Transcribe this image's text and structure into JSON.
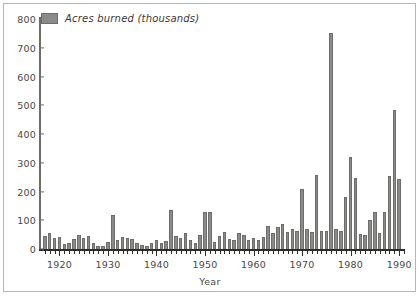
{
  "figure": {
    "background": "#ffffff",
    "frame_color": "#b9b6ae"
  },
  "legend": {
    "label": "Acres burned (thousands)",
    "swatch_color": "#8a8a88"
  },
  "chart_data": {
    "type": "bar",
    "title": "",
    "xlabel": "Year",
    "ylabel": "",
    "ylim": [
      0,
      800
    ],
    "xlim": [
      1916,
      1991
    ],
    "ytick_labels": [
      "0",
      "100",
      "200",
      "300",
      "400",
      "500",
      "600",
      "700",
      "800"
    ],
    "ytick_values": [
      0,
      100,
      200,
      300,
      400,
      500,
      600,
      700,
      800
    ],
    "xtick_labels": [
      "1920",
      "1930",
      "1940",
      "1950",
      "1960",
      "1970",
      "1980",
      "1990"
    ],
    "xtick_values": [
      1920,
      1930,
      1940,
      1950,
      1960,
      1970,
      1980,
      1990
    ],
    "grid": false,
    "legend_position": "top-left",
    "series_name": "Acres burned (thousands)",
    "bar_color": "#8a8a88",
    "categories": [
      1917,
      1918,
      1919,
      1920,
      1921,
      1922,
      1923,
      1924,
      1925,
      1926,
      1927,
      1928,
      1929,
      1930,
      1931,
      1932,
      1933,
      1934,
      1935,
      1936,
      1937,
      1938,
      1939,
      1940,
      1941,
      1942,
      1943,
      1944,
      1945,
      1946,
      1947,
      1948,
      1949,
      1950,
      1951,
      1952,
      1953,
      1954,
      1955,
      1956,
      1957,
      1958,
      1959,
      1960,
      1961,
      1962,
      1963,
      1964,
      1965,
      1966,
      1967,
      1968,
      1969,
      1970,
      1971,
      1972,
      1973,
      1974,
      1975,
      1976,
      1977,
      1978,
      1979,
      1980,
      1981,
      1982,
      1983,
      1984,
      1985,
      1986,
      1987,
      1988,
      1989,
      1990
    ],
    "values": [
      45,
      55,
      38,
      42,
      18,
      20,
      35,
      50,
      40,
      45,
      20,
      12,
      10,
      25,
      118,
      30,
      42,
      38,
      35,
      20,
      15,
      12,
      20,
      30,
      22,
      28,
      135,
      45,
      40,
      55,
      30,
      20,
      50,
      130,
      128,
      25,
      45,
      58,
      35,
      30,
      55,
      48,
      30,
      38,
      32,
      42,
      80,
      55,
      78,
      88,
      60,
      70,
      62,
      210,
      68,
      60,
      258,
      62,
      62,
      750,
      68,
      62,
      180,
      320,
      248,
      52,
      48,
      100,
      128,
      55,
      128,
      255,
      485,
      245
    ]
  },
  "axis": {
    "x_title": "Year"
  }
}
